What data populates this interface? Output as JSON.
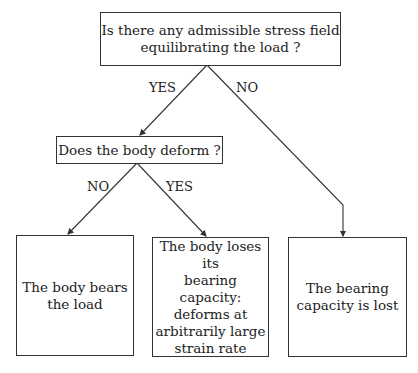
{
  "diagram": {
    "type": "decision-flowchart",
    "nodes": {
      "q1": {
        "text": "Is there any admissible stress field\nequilibrating the load ?"
      },
      "q2": {
        "text": "Does the body deform ?"
      },
      "r_bears": {
        "text": "The body bears\nthe load"
      },
      "r_loses": {
        "text": "The body loses its\nbearing capacity:\ndeforms at\narbitrarily large\nstrain rate"
      },
      "r_lost": {
        "text": "The bearing\ncapacity is lost"
      }
    },
    "edges": {
      "q1_yes": {
        "from": "q1",
        "to": "q2",
        "label": "YES"
      },
      "q1_no": {
        "from": "q1",
        "to": "r_lost",
        "label": "NO"
      },
      "q2_no": {
        "from": "q2",
        "to": "r_bears",
        "label": "NO"
      },
      "q2_yes": {
        "from": "q2",
        "to": "r_loses",
        "label": "YES"
      }
    }
  }
}
